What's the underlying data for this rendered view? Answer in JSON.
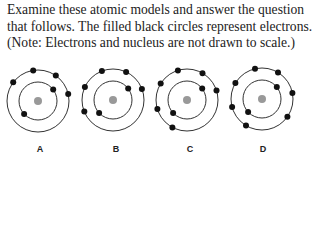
{
  "question": {
    "text": "Examine these atomic models and answer the question that follows. The filled black circles represent electrons. (Note: Electrons and nucleus are not drawn to scale.)"
  },
  "style": {
    "ring_color": "#333333",
    "electron_color": "#111111",
    "nucleus_color": "#999999"
  },
  "models": [
    {
      "label": "A",
      "cx": 38,
      "cy": 101,
      "inner_radius": 19,
      "outer_radius": 31,
      "inner_electron_angles": [
        -37,
        137
      ],
      "outer_electron_angles": [
        -99,
        -55,
        -143,
        -13
      ]
    },
    {
      "label": "B",
      "cx": 113,
      "cy": 100,
      "inner_radius": 19,
      "outer_radius": 31,
      "inner_electron_angles": [
        -37,
        137
      ],
      "outer_electron_angles": [
        -111,
        -65,
        -155,
        -21,
        158
      ]
    },
    {
      "label": "C",
      "cx": 187,
      "cy": 100,
      "inner_radius": 19,
      "outer_radius": 31,
      "inner_electron_angles": [
        -37,
        137
      ],
      "outer_electron_angles": [
        -107,
        -60,
        -148,
        -18,
        163,
        118
      ]
    },
    {
      "label": "D",
      "cx": 262,
      "cy": 99,
      "inner_radius": 19,
      "outer_radius": 31,
      "inner_electron_angles": [
        -39,
        137
      ],
      "outer_electron_angles": [
        -103,
        -59,
        -149,
        -11,
        35,
        121,
        165
      ]
    }
  ]
}
